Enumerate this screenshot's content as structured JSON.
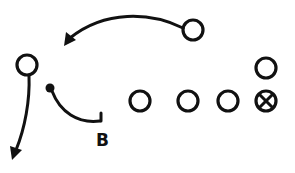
{
  "diagram": {
    "type": "play-diagram",
    "colors": {
      "ink": "#111111",
      "background": "#ffffff"
    },
    "players": [
      {
        "id": "deep-right",
        "symbol": "circle"
      },
      {
        "id": "left-end",
        "symbol": "circle"
      },
      {
        "id": "back-b",
        "symbol": "dot",
        "label": "B"
      },
      {
        "id": "line-1",
        "symbol": "circle"
      },
      {
        "id": "line-2",
        "symbol": "circle"
      },
      {
        "id": "line-3",
        "symbol": "circle"
      },
      {
        "id": "center",
        "symbol": "circle-x"
      },
      {
        "id": "off-center",
        "symbol": "circle"
      }
    ],
    "routes": [
      {
        "from": "deep-right",
        "direction": "left-curve",
        "arrow": true
      },
      {
        "from": "left-end",
        "direction": "down",
        "arrow": true
      },
      {
        "from": "back-b",
        "direction": "curve-to-block",
        "arrow": false
      }
    ],
    "labels": {
      "b": "B"
    }
  }
}
